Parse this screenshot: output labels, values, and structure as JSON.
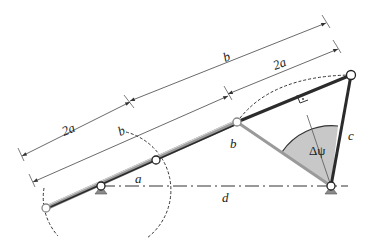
{
  "diagram": {
    "labels": {
      "dim_top_b": "b",
      "dim_top_2a": "2a",
      "dim_left_2a": "2a",
      "dim_left_b": "b",
      "crank_a": "a",
      "coupler_b": "b",
      "rocker_c": "c",
      "ground_d": "d",
      "angle": "Δψ"
    },
    "colors": {
      "link_dark": "#2b2b2b",
      "link_gray": "#9a9a9a",
      "sector_fill": "#c8c8c8",
      "dim_line": "#444444"
    },
    "points": {
      "A0": [
        101,
        186
      ],
      "B0": [
        331,
        186
      ],
      "A": [
        156,
        160
      ],
      "B": [
        237,
        122
      ],
      "C": [
        351,
        75
      ],
      "E": [
        46,
        208
      ]
    }
  }
}
